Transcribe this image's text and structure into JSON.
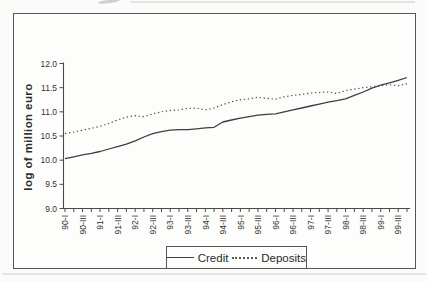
{
  "page": {
    "background": "#fbfbf9",
    "frame_color": "#54565a",
    "axis_color": "#4a4a4a",
    "text_color": "#333333"
  },
  "chart_data": {
    "type": "line",
    "title": "",
    "xlabel": "",
    "ylabel": "log of million euro",
    "ylim": [
      9.0,
      12.0
    ],
    "ytick_step": 0.5,
    "ytick_labels": [
      "9.0",
      "9.5",
      "10.0",
      "10.5",
      "11.0",
      "11.5",
      "12.0"
    ],
    "grid": "off",
    "legend_position": "bottom-center",
    "xtick_label_every": 2,
    "categories": [
      "90-I",
      "90-II",
      "90-III",
      "90-IV",
      "91-I",
      "91-II",
      "91-III",
      "91-IV",
      "92-I",
      "92-II",
      "92-III",
      "92-IV",
      "93-I",
      "93-II",
      "93-III",
      "93-IV",
      "94-I",
      "94-II",
      "94-III",
      "94-IV",
      "95-I",
      "95-II",
      "95-III",
      "95-IV",
      "96-I",
      "96-II",
      "96-III",
      "96-IV",
      "97-I",
      "97-II",
      "97-III",
      "97-IV",
      "98-I",
      "98-II",
      "98-III",
      "98-IV",
      "99-I",
      "99-II",
      "99-III",
      "99-IV"
    ],
    "visible_tick_labels": [
      "90-I",
      "90-III",
      "91-I",
      "91-III",
      "92-I",
      "92-III",
      "93-I",
      "93-III",
      "94-I",
      "94-III",
      "95-I",
      "95-III",
      "96-I",
      "96-III",
      "97-I",
      "97-III",
      "98-I",
      "98-III",
      "99-I",
      "99-III"
    ],
    "series": [
      {
        "name": "Credit",
        "style": "solid",
        "color": "#3f3f3f",
        "values": [
          10.03,
          10.07,
          10.11,
          10.14,
          10.18,
          10.23,
          10.28,
          10.33,
          10.4,
          10.48,
          10.55,
          10.59,
          10.62,
          10.63,
          10.63,
          10.65,
          10.67,
          10.68,
          10.79,
          10.83,
          10.87,
          10.9,
          10.93,
          10.95,
          10.96,
          11.0,
          11.04,
          11.08,
          11.12,
          11.16,
          11.2,
          11.23,
          11.27,
          11.34,
          11.41,
          11.49,
          11.55,
          11.6,
          11.65,
          11.71
        ]
      },
      {
        "name": "Deposits",
        "style": "dotted",
        "color": "#575757",
        "values": [
          10.55,
          10.58,
          10.62,
          10.66,
          10.7,
          10.76,
          10.83,
          10.89,
          10.92,
          10.9,
          10.96,
          11.0,
          11.03,
          11.04,
          11.07,
          11.08,
          11.04,
          11.08,
          11.15,
          11.21,
          11.25,
          11.27,
          11.3,
          11.28,
          11.26,
          11.31,
          11.34,
          11.36,
          11.39,
          11.4,
          11.41,
          11.38,
          11.44,
          11.47,
          11.5,
          11.52,
          11.54,
          11.56,
          11.54,
          11.58
        ]
      }
    ]
  }
}
